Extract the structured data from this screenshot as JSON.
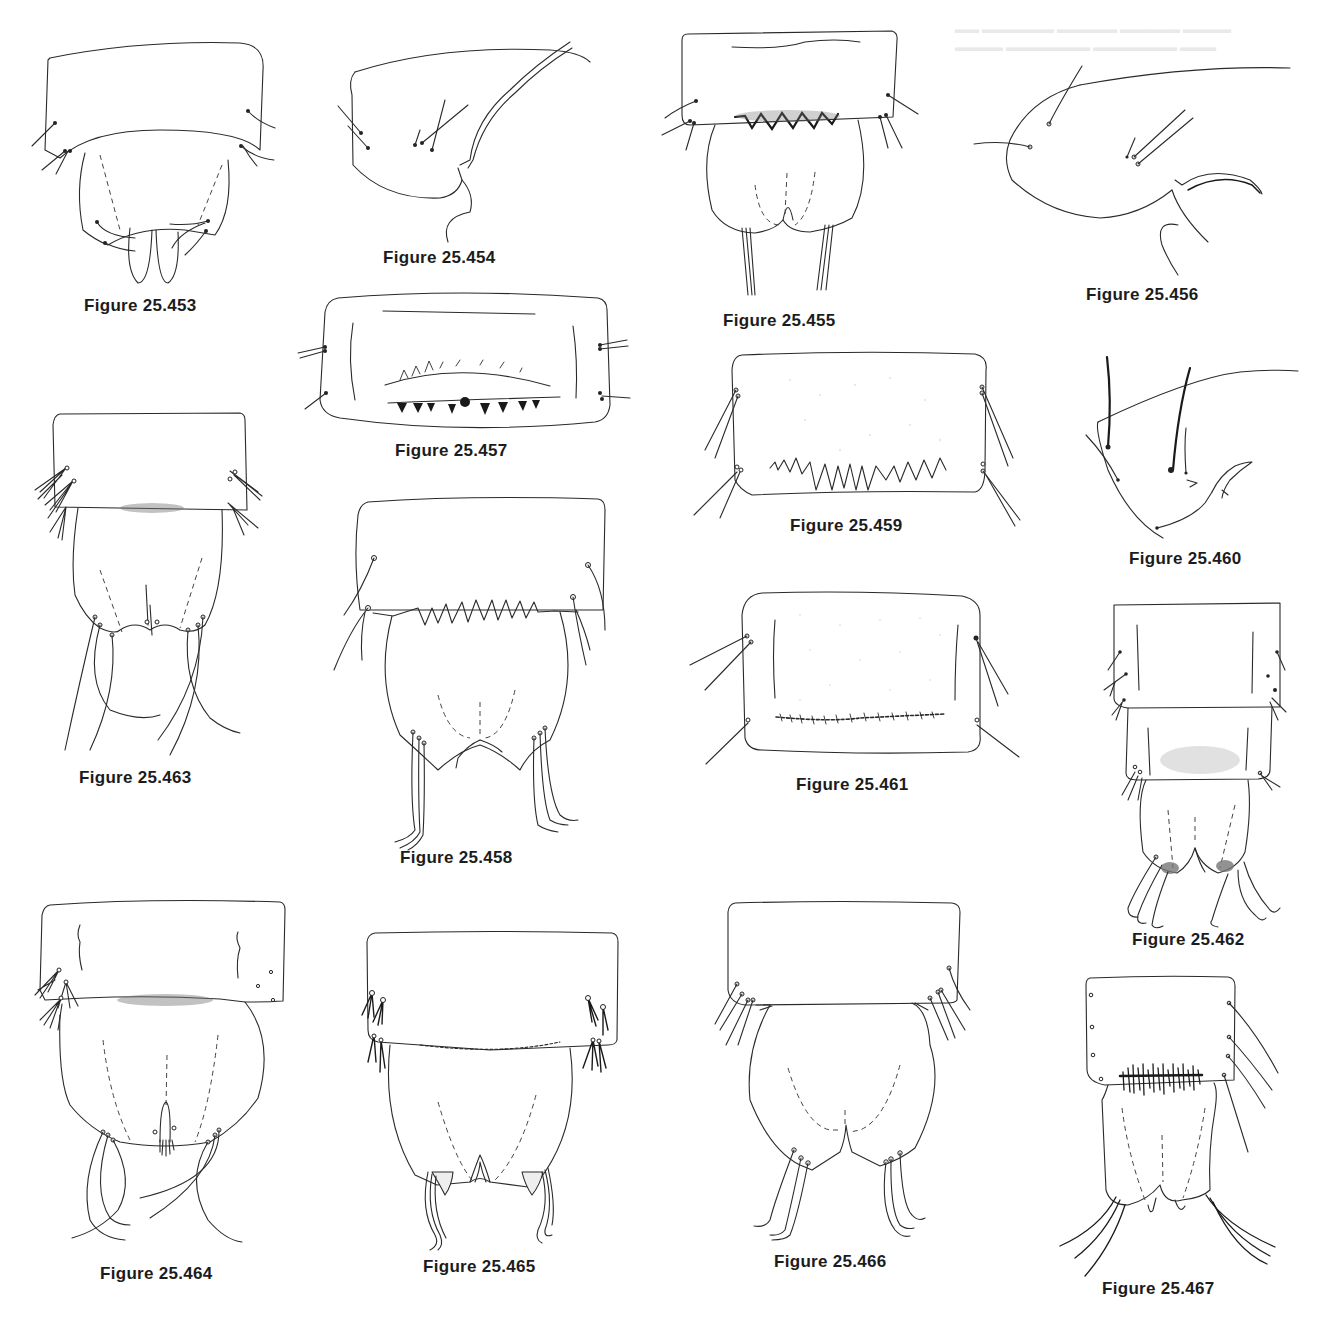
{
  "plate": {
    "background": "#ffffff",
    "ink_color": "#1a1a1a",
    "figures": [
      {
        "id": "453",
        "caption": "Figure 25.453",
        "view": "dorsal segment with anal lobes"
      },
      {
        "id": "454",
        "caption": "Figure 25.454",
        "view": "lateral segment"
      },
      {
        "id": "455",
        "caption": "Figure 25.455",
        "view": "dorsal segment with zigzag spine row"
      },
      {
        "id": "456",
        "caption": "Figure 25.456",
        "view": "lateral segment with hook"
      },
      {
        "id": "457",
        "caption": "Figure 25.457",
        "view": "segment with two spine rows"
      },
      {
        "id": "458",
        "caption": "Figure 25.458",
        "view": "dorsal segment with tooth row"
      },
      {
        "id": "459",
        "caption": "Figure 25.459",
        "view": "segment with irregular spine comb"
      },
      {
        "id": "460",
        "caption": "Figure 25.460",
        "view": "lateral segment with stout setae"
      },
      {
        "id": "461",
        "caption": "Figure 25.461",
        "view": "stippled segment with spinule row"
      },
      {
        "id": "462",
        "caption": "Figure 25.462",
        "view": "two segments with anal lobes"
      },
      {
        "id": "463",
        "caption": "Figure 25.463",
        "view": "segment with tufted setae"
      },
      {
        "id": "464",
        "caption": "Figure 25.464",
        "view": "segment with tufted setae and median process"
      },
      {
        "id": "465",
        "caption": "Figure 25.465",
        "view": "segment with branched setae and stippled lobes"
      },
      {
        "id": "466",
        "caption": "Figure 25.466",
        "view": "segment with rounded anal lobes"
      },
      {
        "id": "467",
        "caption": "Figure 25.467",
        "view": "segment with dense spine patch"
      }
    ]
  }
}
